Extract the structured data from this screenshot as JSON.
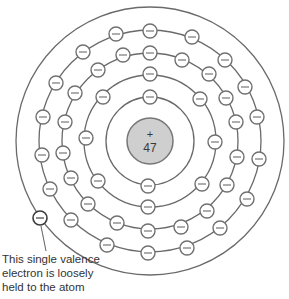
{
  "nucleus": {
    "symbol": "+",
    "atomic_number": "47",
    "cx": 150,
    "cy": 141,
    "r": 23,
    "fill": "#cfcfcf"
  },
  "shells": [
    {
      "name": "shell-1",
      "r": 44,
      "electron_count": 2,
      "electrons": [
        [
          150,
          97
        ],
        [
          148,
          186
        ]
      ]
    },
    {
      "name": "shell-2",
      "r": 66,
      "electron_count": 8,
      "electrons": [
        [
          150,
          74
        ],
        [
          200,
          99
        ],
        [
          215,
          142
        ],
        [
          202,
          184
        ],
        [
          148,
          207
        ],
        [
          98,
          181
        ],
        [
          86,
          138
        ],
        [
          103,
          97
        ]
      ]
    },
    {
      "name": "shell-3",
      "r": 88,
      "electron_count": 18,
      "electrons": [
        [
          150,
          53
        ],
        [
          182,
          60
        ],
        [
          209,
          74
        ],
        [
          226,
          98
        ],
        [
          236,
          122
        ],
        [
          237,
          157
        ],
        [
          227,
          185
        ],
        [
          207,
          211
        ],
        [
          181,
          227
        ],
        [
          148,
          231
        ],
        [
          117,
          223
        ],
        [
          88,
          204
        ],
        [
          71,
          178
        ],
        [
          63,
          153
        ],
        [
          65,
          122
        ],
        [
          75,
          93
        ],
        [
          98,
          70
        ],
        [
          123,
          55
        ]
      ]
    },
    {
      "name": "shell-4",
      "r": 111,
      "electron_count": 18,
      "electrons": [
        [
          150,
          31
        ],
        [
          192,
          37
        ],
        [
          225,
          60
        ],
        [
          245,
          87
        ],
        [
          257,
          117
        ],
        [
          259,
          159
        ],
        [
          247,
          199
        ],
        [
          220,
          228
        ],
        [
          187,
          248
        ],
        [
          148,
          253
        ],
        [
          107,
          245
        ],
        [
          71,
          220
        ],
        [
          50,
          189
        ],
        [
          42,
          155
        ],
        [
          43,
          117
        ],
        [
          56,
          83
        ],
        [
          83,
          52
        ],
        [
          116,
          34
        ]
      ]
    },
    {
      "name": "shell-5",
      "r": 134,
      "electron_count": 1,
      "electrons": [
        [
          40,
          218
        ]
      ]
    }
  ],
  "electron_symbol": "−",
  "annotation": {
    "lines": [
      "This single valence",
      "electron is loosely",
      "held to the atom"
    ],
    "leader_from": [
      41,
      226
    ],
    "leader_to": [
      46,
      251
    ]
  },
  "colors": {
    "shell_stroke": "#6a6a6a",
    "electron_stroke": "#707070",
    "valence_stroke": "#3a3a3a",
    "nucleus_fill": "#cfcfcf",
    "text": "#333333"
  }
}
